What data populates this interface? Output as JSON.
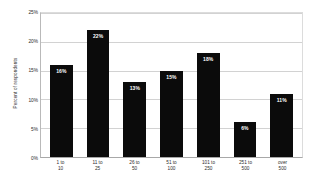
{
  "chart_data": {
    "type": "bar",
    "title": "",
    "subtitle": "",
    "xlabel": "",
    "ylabel": "Percent of respondents",
    "categories": [
      "1 to\n10",
      "11 to\n25",
      "26 to\n50",
      "51 to\n100",
      "101 to\n250",
      "251 to\n500",
      "over\n500"
    ],
    "values": [
      16,
      22,
      13,
      15,
      18,
      6,
      11
    ],
    "data_labels": [
      "16%",
      "22%",
      "13%",
      "15%",
      "18%",
      "6%",
      "11%"
    ],
    "ylim": [
      0,
      25
    ],
    "ytick_values": [
      0,
      5,
      10,
      15,
      20,
      25
    ],
    "ytick_labels": [
      "0%",
      "5%",
      "10%",
      "15%",
      "20%",
      "25%"
    ],
    "grid": true,
    "legend": false,
    "legend_position": "none",
    "bar_color": "#0b0b0b",
    "data_label_color": "#ffffff",
    "gridline_color": "#d2d2d2",
    "plot_background": "#ffffff"
  }
}
